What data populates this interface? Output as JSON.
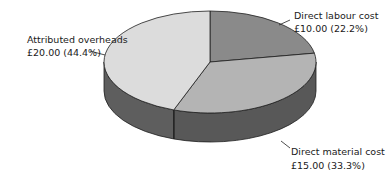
{
  "chart_data": {
    "type": "pie",
    "style": "3d",
    "title": "",
    "currency": "£",
    "slices": [
      {
        "name": "Direct labour cost",
        "value": 10.0,
        "percent": 22.2,
        "value_label": "£10.00 (22.2%)",
        "color": "#8a8a8a",
        "side_color": "#4e4e4e"
      },
      {
        "name": "Direct material cost",
        "value": 15.0,
        "percent": 33.3,
        "value_label": "£15.00 (33.3%)",
        "color": "#b4b4b4",
        "side_color": "#585858"
      },
      {
        "name": "Attributed overheads",
        "value": 20.0,
        "percent": 44.4,
        "value_label": "£20.00 (44.4%)",
        "color": "#dcdcdc",
        "side_color": "#5e5e5e"
      }
    ],
    "start_angle": "12 o'clock",
    "direction": "clockwise",
    "total": 45.0,
    "labels_position": "outside-with-leader-lines"
  }
}
